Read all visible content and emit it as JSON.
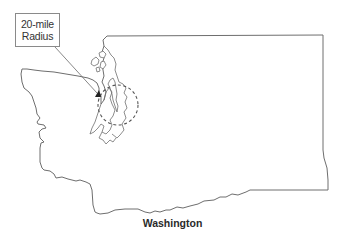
{
  "map": {
    "title": "Washington",
    "region": "Washington State outline",
    "callout": {
      "line1": "20-mile",
      "line2": "Radius"
    },
    "features": [
      {
        "type": "state-outline",
        "name": "Washington"
      },
      {
        "type": "dashed-circle",
        "meaning": "20-mile radius",
        "center_px": [
          118,
          105
        ],
        "radius_px": 20
      },
      {
        "type": "point-marker",
        "location_px": [
          98,
          94
        ]
      },
      {
        "type": "water-body",
        "name": "Puget Sound"
      },
      {
        "type": "islands",
        "name": "San Juan Islands"
      }
    ],
    "colors": {
      "outline": "#6e6e6e",
      "background": "#ffffff",
      "marker": "#222222"
    }
  }
}
